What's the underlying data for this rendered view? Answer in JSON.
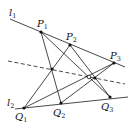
{
  "diagram": {
    "title": "",
    "lines": {
      "l1": {
        "label": "l",
        "sub": "1",
        "from": [
          10,
          19
        ],
        "to": [
          125,
          67
        ],
        "label_pos": [
          9,
          16
        ]
      },
      "l2": {
        "label": "l",
        "sub": "2",
        "from": [
          15,
          109
        ],
        "to": [
          128,
          97
        ],
        "label_pos": [
          7,
          106
        ]
      },
      "pappus": {
        "style": "dashed",
        "from": [
          8,
          61
        ],
        "to": [
          125,
          84
        ]
      }
    },
    "points": {
      "P1": {
        "label": "P",
        "sub": "1",
        "pos": [
          41,
          32
        ],
        "label_pos": [
          37,
          27
        ]
      },
      "P2": {
        "label": "P",
        "sub": "2",
        "pos": [
          70,
          45
        ],
        "label_pos": [
          66,
          40
        ]
      },
      "P3": {
        "label": "P",
        "sub": "3",
        "pos": [
          114,
          63
        ],
        "label_pos": [
          110,
          59
        ]
      },
      "Q1": {
        "label": "Q",
        "sub": "1",
        "pos": [
          24,
          108
        ],
        "label_pos": [
          15,
          120
        ]
      },
      "Q2": {
        "label": "Q",
        "sub": "2",
        "pos": [
          61,
          103
        ],
        "label_pos": [
          53,
          116
        ]
      },
      "Q3": {
        "label": "Q",
        "sub": "3",
        "pos": [
          110,
          97
        ],
        "label_pos": [
          101,
          110
        ]
      }
    },
    "segments": [
      {
        "name": "P1-Q2",
        "from": [
          41,
          32
        ],
        "to": [
          61,
          103
        ]
      },
      {
        "name": "P1-Q3",
        "from": [
          41,
          32
        ],
        "to": [
          110,
          97
        ]
      },
      {
        "name": "P2-Q1",
        "from": [
          70,
          45
        ],
        "to": [
          24,
          108
        ]
      },
      {
        "name": "P2-Q3",
        "from": [
          70,
          45
        ],
        "to": [
          110,
          97
        ]
      },
      {
        "name": "P3-Q1",
        "from": [
          114,
          63
        ],
        "to": [
          24,
          108
        ]
      },
      {
        "name": "P3-Q2",
        "from": [
          114,
          63
        ],
        "to": [
          61,
          103
        ]
      }
    ],
    "intersections": [
      {
        "name": "X12",
        "pos": [
          52,
          69
        ],
        "hollow": false
      },
      {
        "name": "X13",
        "pos": [
          89,
          77
        ],
        "hollow": true
      },
      {
        "name": "X23",
        "pos": [
          95,
          78
        ],
        "hollow": false
      }
    ]
  }
}
